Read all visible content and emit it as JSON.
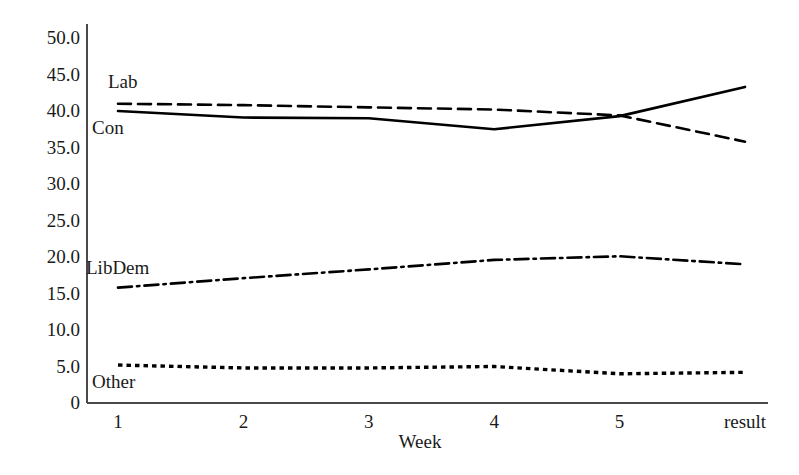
{
  "chart_data": {
    "type": "line",
    "title": "",
    "xlabel": "Week",
    "ylabel": "",
    "categories": [
      "1",
      "2",
      "3",
      "4",
      "5",
      "result"
    ],
    "x_tick_labels": [
      "1",
      "2",
      "3",
      "4",
      "5",
      "result"
    ],
    "y_tick_labels": [
      "50.0",
      "45.0",
      "40.0",
      "35.0",
      "30.0",
      "25.0",
      "20.0",
      "15.0",
      "10.0",
      "5.0",
      "0"
    ],
    "y_tick_values": [
      50,
      45,
      40,
      35,
      30,
      25,
      20,
      15,
      10,
      5,
      0
    ],
    "ylim": [
      0,
      52
    ],
    "xlim": [
      0.6,
      6.4
    ],
    "grid": false,
    "legend_position": "inline-labels",
    "series": [
      {
        "name": "Lab",
        "label": "Lab",
        "style": "dashed",
        "color": "#000000",
        "values": [
          41.0,
          40.8,
          40.5,
          40.2,
          39.4,
          35.8
        ]
      },
      {
        "name": "Con",
        "label": "Con",
        "style": "solid",
        "color": "#000000",
        "values": [
          40.0,
          39.1,
          39.0,
          37.5,
          39.3,
          43.3
        ]
      },
      {
        "name": "LibDem",
        "label": "LibDem",
        "style": "dash-dot",
        "color": "#000000",
        "values": [
          15.8,
          17.1,
          18.3,
          19.6,
          20.1,
          19.0
        ]
      },
      {
        "name": "Other",
        "label": "Other",
        "style": "dotted",
        "color": "#000000",
        "values": [
          5.2,
          4.8,
          4.8,
          5.0,
          4.0,
          4.2
        ]
      }
    ],
    "annotations": [
      {
        "text": "Lab",
        "series": "Lab",
        "placement": "above-left"
      },
      {
        "text": "Con",
        "series": "Con",
        "placement": "below-left"
      },
      {
        "text": "LibDem",
        "series": "LibDem",
        "placement": "above-left"
      },
      {
        "text": "Other",
        "series": "Other",
        "placement": "below-left"
      }
    ]
  },
  "axes": {
    "axis_color": "#4a4a4a",
    "background": "#ffffff",
    "x_axis_title": "Week"
  }
}
